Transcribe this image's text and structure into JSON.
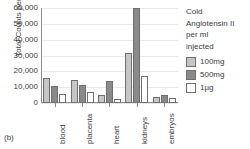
{
  "panel_label": "(b)",
  "legend": {
    "title_lines": [
      "Cold",
      "Angiotensin II",
      "per ml",
      "injected"
    ],
    "items": [
      {
        "label": "100mg",
        "color": "#c6c6c6"
      },
      {
        "label": "500mg",
        "color": "#8a8a8a"
      },
      {
        "label": "1µg",
        "color": "#ffffff"
      }
    ]
  },
  "chart_data": {
    "type": "bar",
    "title": "",
    "xlabel": "",
    "ylabel": "Total Counts per min",
    "categories": [
      "blood",
      "placenta",
      "heart",
      "kidneys",
      "embryos"
    ],
    "series": [
      {
        "name": "100mg",
        "color": "#c6c6c6",
        "values": [
          15500,
          14300,
          5300,
          31500,
          3600
        ]
      },
      {
        "name": "500mg",
        "color": "#8a8a8a",
        "values": [
          11000,
          11400,
          14000,
          60000,
          5200
        ]
      },
      {
        "name": "1µg",
        "color": "#ffffff",
        "values": [
          5700,
          7200,
          2400,
          17300,
          3000
        ]
      }
    ],
    "ylim": [
      0,
      60000
    ],
    "ytick_values": [
      0,
      10000,
      20000,
      30000,
      40000,
      50000,
      60000
    ],
    "ytick_labels": [
      "0",
      "10,000",
      "20,000",
      "30,000",
      "40,000",
      "50,000",
      "60,000"
    ],
    "grid": true,
    "grid_axis": "y",
    "legend_position": "right"
  }
}
